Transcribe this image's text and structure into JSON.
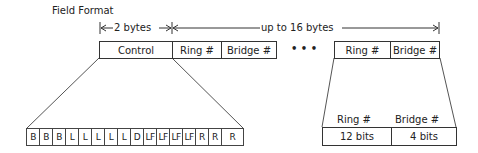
{
  "title": "Field Format",
  "dimensions": {
    "two_bytes": "2 bytes",
    "up_to_16": "up to 16 bytes"
  },
  "top_fields": {
    "control": "Control",
    "ring": "Ring #",
    "bridge": "Bridge #",
    "ellipsis": "• • •",
    "ring_last": "Ring #",
    "bridge_last": "Bridge #"
  },
  "control_bits": [
    "B",
    "B",
    "B",
    "L",
    "L",
    "L",
    "L",
    "L",
    "D",
    "LF",
    "LF",
    "LF",
    "LF",
    "R",
    "R",
    "R"
  ],
  "detail": {
    "ring_header": "Ring #",
    "bridge_header": "Bridge #",
    "ring_bits": "12 bits",
    "bridge_bits": "4 bits"
  }
}
